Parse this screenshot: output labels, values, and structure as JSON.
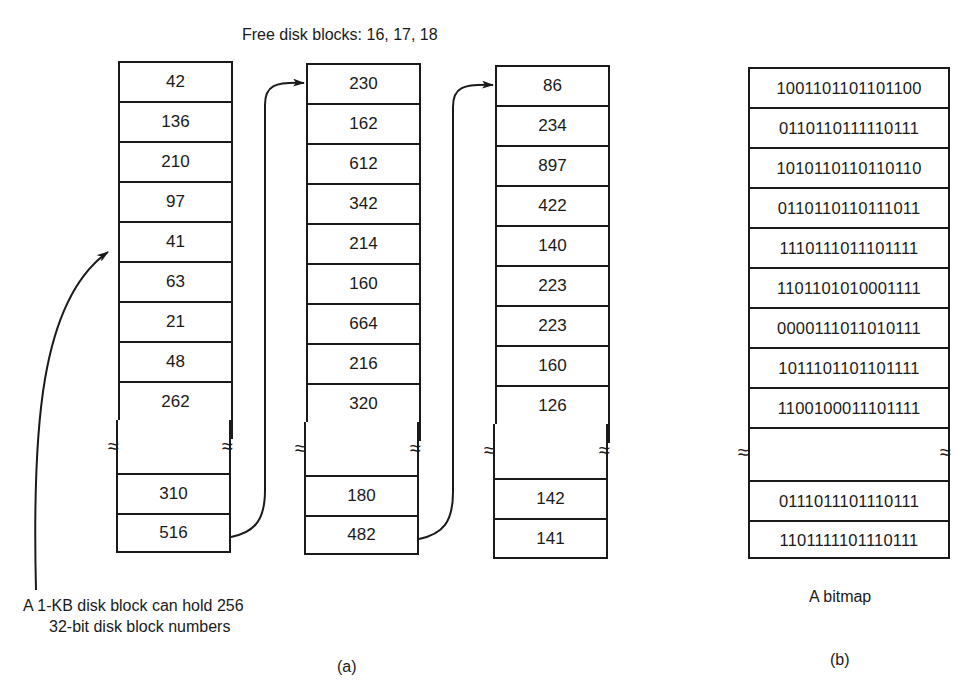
{
  "header": {
    "free_blocks_label": "Free disk blocks: 16, 17, 18"
  },
  "part_a": {
    "columns": [
      {
        "top": [
          "42",
          "136",
          "210",
          "97",
          "41",
          "63",
          "21",
          "48",
          "262"
        ],
        "bottom": [
          "310",
          "516"
        ]
      },
      {
        "top": [
          "230",
          "162",
          "612",
          "342",
          "214",
          "160",
          "664",
          "216",
          "320"
        ],
        "bottom": [
          "180",
          "482"
        ]
      },
      {
        "top": [
          "86",
          "234",
          "897",
          "422",
          "140",
          "223",
          "223",
          "160",
          "126"
        ],
        "bottom": [
          "142",
          "141"
        ]
      }
    ],
    "annotation_line1": "A 1-KB disk block can hold 256",
    "annotation_line2": "32-bit disk block numbers",
    "label": "(a)"
  },
  "part_b": {
    "rows_top": [
      "1001101101101100",
      "0110110111110111",
      "1010110110110110",
      "0110110110111011",
      "1110111011101111",
      "1101101010001111",
      "0000111011010111",
      "1011101101101111",
      "1100100011101111"
    ],
    "rows_bottom": [
      "0111011101110111",
      "1101111101110111"
    ],
    "caption": "A bitmap",
    "label": "(b)"
  },
  "symbols": {
    "break": "≈"
  }
}
